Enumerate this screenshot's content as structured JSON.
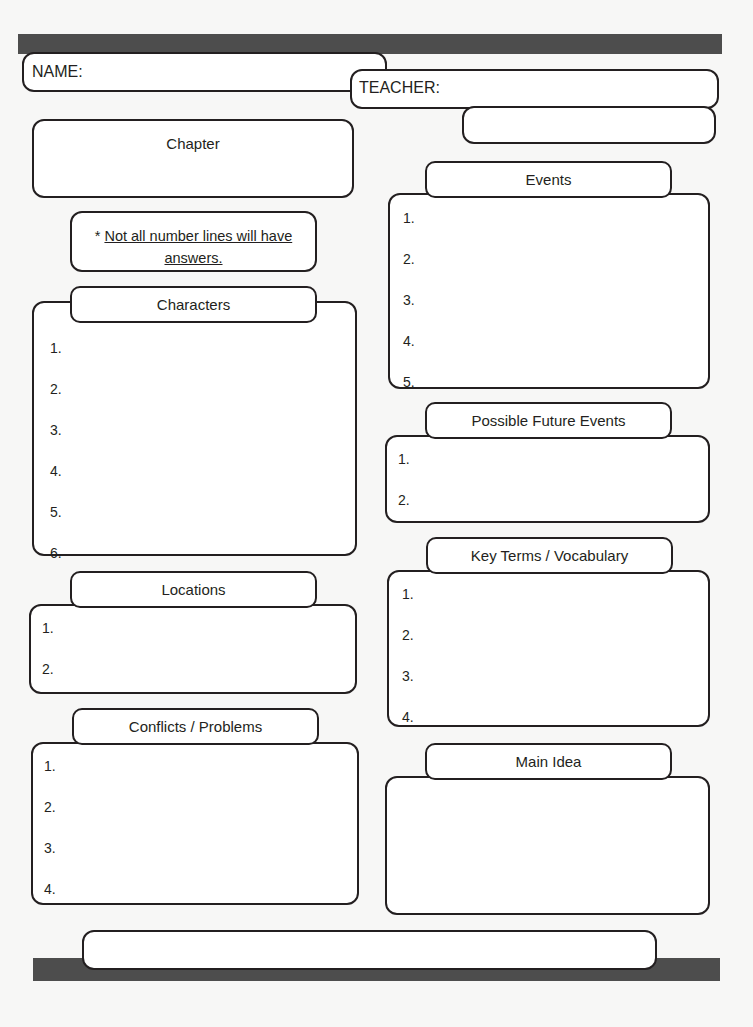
{
  "document": {
    "title": "Chapter Notes Graphic Organizer",
    "background_color": "#f7f7f6",
    "bar_color": "#4d4d4d",
    "ink_color": "#231f20"
  },
  "header": {
    "name_label": "NAME:",
    "teacher_label": "TEACHER:",
    "date_label": "Date:"
  },
  "left_column": {
    "chapter": {
      "title": "Chapter"
    },
    "note": {
      "asterisk": "* ",
      "text": "Not all number lines will have answers."
    },
    "characters": {
      "title": "Characters",
      "items": [
        "1.",
        "2.",
        "3.",
        "4.",
        "5.",
        "6."
      ]
    },
    "locations": {
      "title": "Locations",
      "items": [
        "1.",
        "2."
      ]
    },
    "conflicts": {
      "title": "Conflicts / Problems",
      "items": [
        "1.",
        "2.",
        "3.",
        "4."
      ]
    }
  },
  "right_column": {
    "events": {
      "title": "Events",
      "items": [
        "1.",
        "2.",
        "3.",
        "4.",
        "5."
      ]
    },
    "possible_future_events": {
      "title": "Possible Future Events",
      "items": [
        "1.",
        "2."
      ]
    },
    "key_terms": {
      "title": "Key Terms / Vocabulary",
      "items": [
        "1.",
        "2.",
        "3.",
        "4."
      ]
    },
    "main_idea": {
      "title": "Main Idea"
    }
  },
  "footer": {
    "blank_field": ""
  }
}
